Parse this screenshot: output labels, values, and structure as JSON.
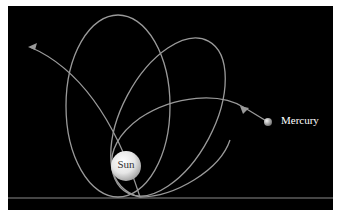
{
  "diagram": {
    "type": "orbital-precession",
    "background": "#000000",
    "orbit_color": "#9a9a9a",
    "labels": {
      "sun": "Sun",
      "planet": "Mercury"
    },
    "icons": {
      "sun": "sun-sphere",
      "planet": "planet-sphere",
      "direction": "arrowhead"
    }
  }
}
